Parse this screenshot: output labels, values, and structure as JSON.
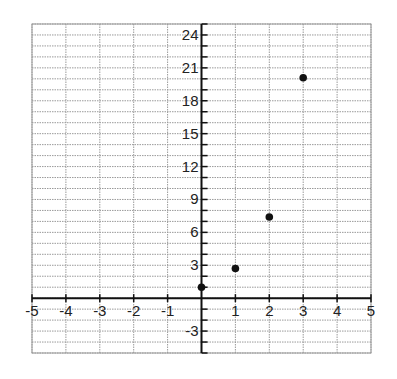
{
  "chart_data": {
    "type": "scatter",
    "title": "",
    "xlabel": "",
    "ylabel": "",
    "xlim": [
      -5,
      5
    ],
    "ylim": [
      -5,
      25
    ],
    "grid": true,
    "grid_step_x": 1,
    "grid_step_y": 1,
    "x_ticks": [
      -5,
      -4,
      -3,
      -2,
      -1,
      1,
      2,
      3,
      4,
      5
    ],
    "x_tick_labels": [
      "-5",
      "-4",
      "-3",
      "-2",
      "-1",
      "1",
      "2",
      "3",
      "4",
      "5"
    ],
    "y_ticks": [
      -3,
      3,
      6,
      9,
      12,
      15,
      18,
      21,
      24
    ],
    "y_tick_labels": [
      "-3",
      "3",
      "6",
      "9",
      "12",
      "15",
      "18",
      "21",
      "24"
    ],
    "series": [
      {
        "name": "points",
        "x": [
          0,
          1,
          2,
          3
        ],
        "y": [
          1,
          2.7,
          7.4,
          20.1
        ],
        "marker": "circle",
        "color": "#111111"
      }
    ],
    "legend": null
  },
  "colors": {
    "grid": "#9a9a9a",
    "axis": "#111111",
    "point": "#111111",
    "background": "#ffffff"
  }
}
